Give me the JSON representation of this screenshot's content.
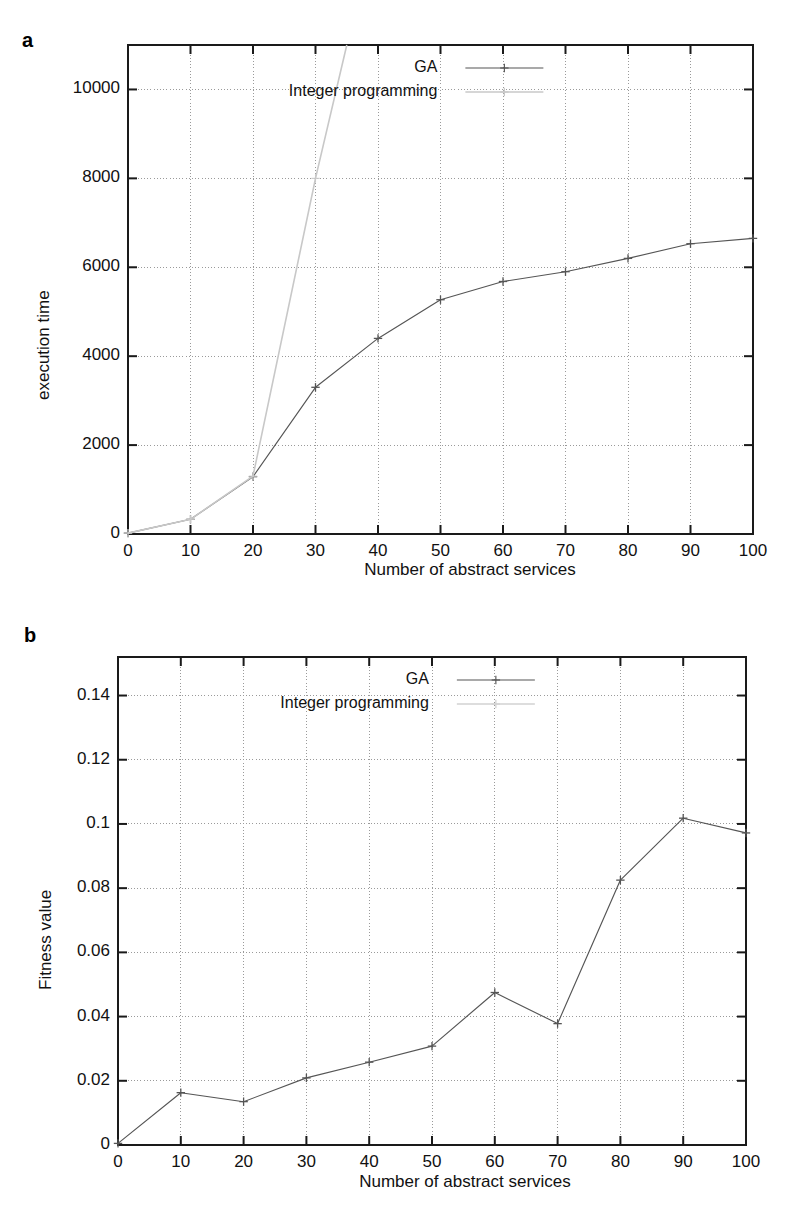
{
  "figure": {
    "panels": [
      {
        "letter": "a",
        "xlabel": "Number of abstract services",
        "ylabel": "execution time",
        "xticks": [
          "0",
          "10",
          "20",
          "30",
          "40",
          "50",
          "60",
          "70",
          "80",
          "90",
          "100"
        ],
        "yticks": [
          "0",
          "2000",
          "4000",
          "6000",
          "8000",
          "10000"
        ],
        "legend": [
          "GA",
          "Integer programming"
        ]
      },
      {
        "letter": "b",
        "xlabel": "Number of abstract services",
        "ylabel": "Fitness value",
        "xticks": [
          "0",
          "10",
          "20",
          "30",
          "40",
          "50",
          "60",
          "70",
          "80",
          "90",
          "100"
        ],
        "yticks": [
          "0",
          "0.02",
          "0.04",
          "0.06",
          "0.08",
          "0.1",
          "0.12",
          "0.14"
        ],
        "legend": [
          "GA",
          "Integer programming"
        ]
      }
    ]
  },
  "chart_data": [
    {
      "type": "line",
      "panel": "a",
      "title": "",
      "xlabel": "Number of abstract services",
      "ylabel": "execution time",
      "xlim": [
        0,
        100
      ],
      "ylim": [
        0,
        11000
      ],
      "xticks": [
        0,
        10,
        20,
        30,
        40,
        50,
        60,
        70,
        80,
        90,
        100
      ],
      "yticks": [
        0,
        2000,
        4000,
        6000,
        8000,
        10000
      ],
      "grid": true,
      "legend_position": "top-center",
      "series": [
        {
          "name": "GA",
          "marker": "plus",
          "color": "#555555",
          "x": [
            0,
            10,
            20,
            30,
            40,
            50,
            60,
            70,
            80,
            90,
            100
          ],
          "values": [
            20,
            330,
            1290,
            3300,
            4400,
            5270,
            5680,
            5900,
            6200,
            6530,
            6650
          ]
        },
        {
          "name": "Integer programming",
          "marker": "plus",
          "color": "#c8c8c8",
          "x": [
            0,
            10,
            20,
            30,
            35
          ],
          "values": [
            20,
            330,
            1300,
            8000,
            11000
          ]
        }
      ]
    },
    {
      "type": "line",
      "panel": "b",
      "title": "",
      "xlabel": "Number of abstract services",
      "ylabel": "Fitness value",
      "xlim": [
        0,
        100
      ],
      "ylim": [
        0,
        0.152
      ],
      "xticks": [
        0,
        10,
        20,
        30,
        40,
        50,
        60,
        70,
        80,
        90,
        100
      ],
      "yticks": [
        0,
        0.02,
        0.04,
        0.06,
        0.08,
        0.1,
        0.12,
        0.14
      ],
      "grid": true,
      "legend_position": "top-center",
      "series": [
        {
          "name": "GA",
          "marker": "plus",
          "color": "#555555",
          "x": [
            0,
            10,
            20,
            30,
            40,
            50,
            60,
            70,
            80,
            90,
            100
          ],
          "values": [
            0.0005,
            0.0163,
            0.0135,
            0.0209,
            0.0258,
            0.0308,
            0.0475,
            0.0378,
            0.0825,
            0.1018,
            0.0972
          ]
        },
        {
          "name": "Integer programming",
          "marker": "plus",
          "color": "#d2d2d2",
          "x": [],
          "values": []
        }
      ]
    }
  ],
  "colors": {
    "axis": "#1a1a1a",
    "grid": "#9a9a9a",
    "ga_line": "#555555",
    "ip_line": "#cccccc",
    "text": "#111111"
  }
}
